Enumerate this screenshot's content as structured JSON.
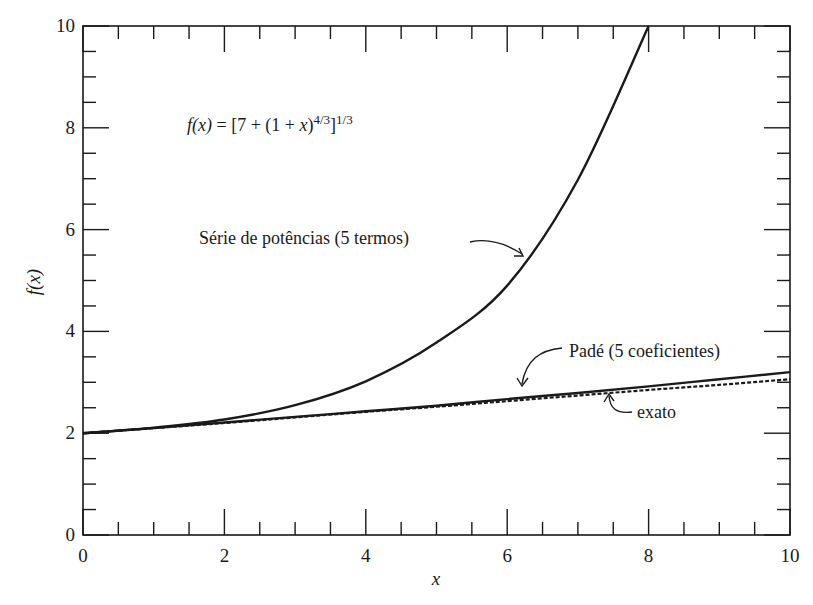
{
  "chart_data": {
    "type": "line",
    "title": "",
    "xlabel": "x",
    "ylabel": "f(x)",
    "xlim": [
      0,
      10
    ],
    "ylim": [
      0,
      10
    ],
    "grid": false,
    "x_ticks": {
      "major": [
        0,
        2,
        4,
        6,
        8,
        10
      ],
      "minor_step": 0.5
    },
    "y_ticks": {
      "major": [
        0,
        2,
        4,
        6,
        8,
        10
      ],
      "minor_step": 0.5
    },
    "x_tick_labels": [
      "0",
      "2",
      "4",
      "6",
      "8",
      "10"
    ],
    "y_tick_labels": [
      "0",
      "2",
      "4",
      "6",
      "8",
      "10"
    ],
    "equation": {
      "lhs": "f(x)",
      "eq": " = [7 + (1 + ",
      "var": "x",
      "close": ")",
      "exp1": "4/3",
      "bracket": "]",
      "exp2": "1/3"
    },
    "series": [
      {
        "name": "Série de potências (5 termos)",
        "style": "solid",
        "x": [
          0,
          1,
          2,
          3,
          4,
          5,
          6,
          7,
          8
        ],
        "y": [
          2.0,
          2.11,
          2.27,
          2.55,
          3.02,
          3.78,
          4.9,
          6.98,
          10.0
        ]
      },
      {
        "name": "Padé (5 coeficientes)",
        "style": "solid",
        "x": [
          0,
          1,
          2,
          3,
          4,
          5,
          6,
          7,
          8,
          9,
          10
        ],
        "y": [
          2.0,
          2.1,
          2.21,
          2.32,
          2.43,
          2.54,
          2.67,
          2.79,
          2.92,
          3.06,
          3.2
        ]
      },
      {
        "name": "exato",
        "style": "dashed",
        "x": [
          0,
          1,
          2,
          3,
          4,
          5,
          6,
          7,
          8,
          9,
          10
        ],
        "y": [
          2.0,
          2.1,
          2.2,
          2.31,
          2.42,
          2.52,
          2.63,
          2.74,
          2.85,
          2.95,
          3.06
        ]
      }
    ],
    "annotations": [
      {
        "text": "Série de potências (5 termos)",
        "points_to": "Série de potências (5 termos)"
      },
      {
        "text": "Padé (5 coeficientes)",
        "points_to": "Padé (5 coeficientes)"
      },
      {
        "text": "exato",
        "points_to": "exato"
      }
    ]
  }
}
